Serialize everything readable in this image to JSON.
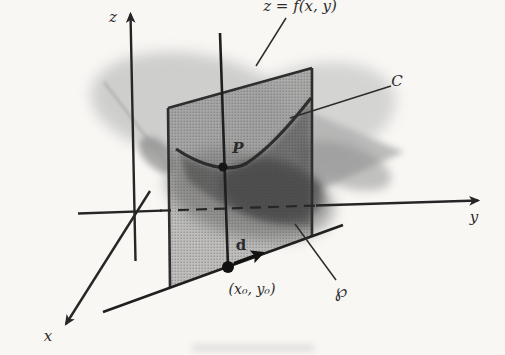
{
  "figure": {
    "labels": {
      "surface_equation": "z = f(x, y)",
      "z_axis": "z",
      "y_axis": "y",
      "x_axis": "x",
      "curve": "C",
      "point_p": "P",
      "direction_vector": "d",
      "base_point": "(x₀, y₀)",
      "plane": "℘"
    }
  },
  "colors": {
    "background": "#f8f7f4",
    "ink": "#262626",
    "plane_fill": "#696969",
    "surface_light": "#c3c3c3",
    "surface_mid": "#6e6e6e",
    "surface_dark": "#3a3a3a",
    "dark_core": "#262626"
  }
}
